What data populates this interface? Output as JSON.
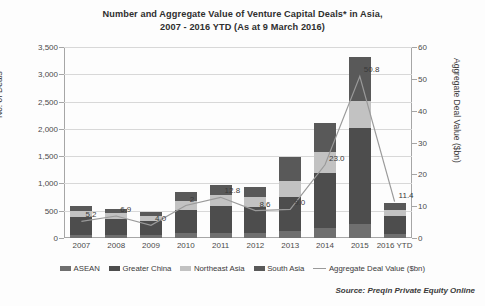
{
  "chart_data": {
    "type": "bar",
    "title": "Number and Aggregate Value of Venture Capital Deals* in Asia,",
    "subtitle": "2007 - 2016 YTD (As at 9 March 2016)",
    "categories": [
      "2007",
      "2008",
      "2009",
      "2010",
      "2011",
      "2012",
      "2013",
      "2014",
      "2015",
      "2016 YTD"
    ],
    "xlabel": "",
    "ylabel": "No. of Deals",
    "ylabel_right": "Aggregate Deal Value ($bn)",
    "ylim": [
      0,
      3500
    ],
    "ylim_right": [
      0,
      60
    ],
    "yticks": [
      "0",
      "500",
      "1,000",
      "1,500",
      "2,000",
      "2,500",
      "3,000",
      "3,500"
    ],
    "yticks_right": [
      "0",
      "10",
      "20",
      "30",
      "40",
      "50",
      "60"
    ],
    "grid": true,
    "legend_position": "bottom",
    "series": [
      {
        "name": "ASEAN",
        "type": "bar",
        "color": "#6f6f6f",
        "values": [
          60,
          55,
          50,
          85,
          95,
          95,
          130,
          175,
          260,
          70
        ]
      },
      {
        "name": "Greater China",
        "type": "bar",
        "color": "#4d4d4d",
        "values": [
          330,
          300,
          270,
          430,
          500,
          480,
          620,
          1020,
          1750,
          330
        ]
      },
      {
        "name": "Northeast Asia",
        "type": "bar",
        "color": "#c2c2c2",
        "values": [
          105,
          95,
          90,
          170,
          190,
          185,
          290,
          390,
          500,
          110
        ]
      },
      {
        "name": "South Asia",
        "type": "bar",
        "color": "#595959",
        "values": [
          90,
          80,
          75,
          155,
          195,
          180,
          440,
          515,
          815,
          140
        ]
      },
      {
        "name": "Aggregate Deal Value ($bn)",
        "type": "line",
        "color": "#9a9a9a",
        "axis": "right",
        "values": [
          5.2,
          6.9,
          4.0,
          10.2,
          12.8,
          8.6,
          9.0,
          23.0,
          50.8,
          11.4
        ],
        "labels": [
          "5.2",
          "6.9",
          "4.0",
          "2",
          "12.8",
          "8.6",
          "9.0",
          "23.0",
          "50.8",
          "11.4"
        ]
      }
    ],
    "totals": [
      585,
      530,
      485,
      840,
      980,
      940,
      1480,
      2100,
      3325,
      650
    ],
    "source": "Source: Preqin Private Equity Online"
  }
}
